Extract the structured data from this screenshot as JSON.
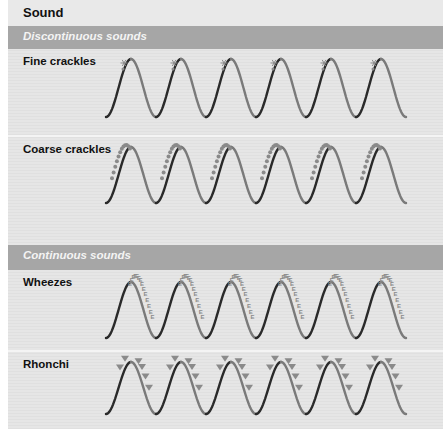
{
  "title": "Sound",
  "sections": [
    {
      "label": "Discontinuous sounds",
      "rows": [
        {
          "label": "Fine crackles",
          "marker": "fine-crackle-star"
        },
        {
          "label": "Coarse crackles",
          "marker": "coarse-crackle-dots"
        }
      ]
    },
    {
      "label": "Continuous sounds",
      "rows": [
        {
          "label": "Wheezes",
          "marker": "wheeze-E-glyphs",
          "glyph": "E"
        },
        {
          "label": "Rhonchi",
          "marker": "rhonchi-triangles"
        }
      ]
    }
  ],
  "colors": {
    "wave_dark": "#2a2a2a",
    "wave_light": "#7a7a7a",
    "marker": "#8a8a8a",
    "band": "#a6a6a6",
    "band_text": "#f4f4f4"
  },
  "wave": {
    "cycles": 6,
    "period_px": 50
  }
}
